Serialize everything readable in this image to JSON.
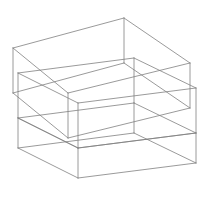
{
  "figure": {
    "kind": "isometric-wireframe-line-drawing",
    "canvas": {
      "width": 203,
      "height": 200,
      "background": "#ffffff"
    },
    "style": {
      "stroke_color": "#808080",
      "stroke_width": 0.8,
      "fill": "none",
      "hidden_lines": "visible"
    },
    "projection": {
      "type": "isometric",
      "axis_x_screen": [
        0.866,
        0.5
      ],
      "axis_y_screen": [
        -0.866,
        0.5
      ],
      "axis_z_screen": [
        0,
        -1
      ]
    },
    "shapes": [
      {
        "name": "upper-box",
        "label": "Upper box",
        "stroke": "#808080",
        "vertices": {
          "top_back": [
            124,
            18
          ],
          "top_left": [
            13,
            48
          ],
          "top_right": [
            190,
            63
          ],
          "top_front": [
            68,
            93
          ],
          "bot_back": [
            124,
            63
          ],
          "bot_left": [
            13,
            93
          ],
          "bot_right": [
            190,
            108
          ],
          "bot_front": [
            68,
            138
          ]
        },
        "edges": [
          [
            "top_back",
            "top_left"
          ],
          [
            "top_back",
            "top_right"
          ],
          [
            "top_left",
            "top_front"
          ],
          [
            "top_right",
            "top_front"
          ],
          [
            "bot_back",
            "bot_left"
          ],
          [
            "bot_back",
            "bot_right"
          ],
          [
            "bot_left",
            "bot_front"
          ],
          [
            "bot_right",
            "bot_front"
          ],
          [
            "top_back",
            "bot_back"
          ],
          [
            "top_left",
            "bot_left"
          ],
          [
            "top_right",
            "bot_right"
          ],
          [
            "top_front",
            "bot_front"
          ]
        ]
      },
      {
        "name": "lower-box",
        "label": "Lower box",
        "stroke": "#808080",
        "vertices": {
          "top_back": [
            134,
            58
          ],
          "top_left": [
            18,
            73
          ],
          "top_right": [
            196,
            88
          ],
          "top_front": [
            78,
            103
          ],
          "bot_back": [
            134,
            103
          ],
          "bot_left": [
            18,
            118
          ],
          "bot_right": [
            196,
            133
          ],
          "bot_front": [
            78,
            148
          ]
        },
        "edges": [
          [
            "top_back",
            "top_left"
          ],
          [
            "top_back",
            "top_right"
          ],
          [
            "top_left",
            "top_front"
          ],
          [
            "top_right",
            "top_front"
          ],
          [
            "bot_back",
            "bot_left"
          ],
          [
            "bot_back",
            "bot_right"
          ],
          [
            "bot_left",
            "bot_front"
          ],
          [
            "bot_right",
            "bot_front"
          ],
          [
            "top_back",
            "bot_back"
          ],
          [
            "top_left",
            "bot_left"
          ],
          [
            "top_right",
            "bot_right"
          ],
          [
            "top_front",
            "bot_front"
          ]
        ]
      },
      {
        "name": "front-box",
        "label": "Front lower box",
        "stroke": "#808080",
        "vertices": {
          "top_back": [
            134,
            103
          ],
          "top_left": [
            18,
            118
          ],
          "top_right": [
            196,
            133
          ],
          "top_front": [
            78,
            148
          ],
          "bot_back": [
            134,
            133
          ],
          "bot_left": [
            18,
            148
          ],
          "bot_right": [
            196,
            163
          ],
          "bot_front": [
            78,
            178
          ]
        },
        "edges": [
          [
            "top_left",
            "top_front"
          ],
          [
            "top_right",
            "top_front"
          ],
          [
            "bot_back",
            "bot_left"
          ],
          [
            "bot_back",
            "bot_right"
          ],
          [
            "bot_left",
            "bot_front"
          ],
          [
            "bot_right",
            "bot_front"
          ],
          [
            "top_back",
            "bot_back"
          ],
          [
            "top_left",
            "bot_left"
          ],
          [
            "top_right",
            "bot_right"
          ],
          [
            "top_front",
            "bot_front"
          ]
        ]
      }
    ]
  }
}
